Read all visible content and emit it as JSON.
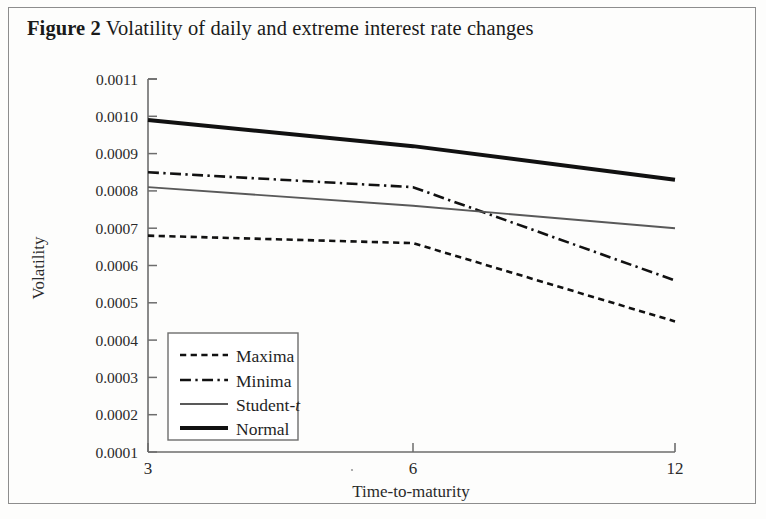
{
  "figure": {
    "label": "Figure 2",
    "title": "Volatility of daily and extreme interest rate changes"
  },
  "chart_data": {
    "type": "line",
    "title": "Volatility of daily and extreme interest rate changes",
    "xlabel": "Time-to-maturity",
    "ylabel": "Volatility",
    "x_ticks": [
      3,
      6,
      12
    ],
    "x_tick_labels": [
      "3",
      "6",
      "12"
    ],
    "xlim": [
      3,
      12
    ],
    "y_ticks": [
      0.0001,
      0.0002,
      0.0003,
      0.0004,
      0.0005,
      0.0006,
      0.0007,
      0.0008,
      0.0009,
      0.001,
      0.0011
    ],
    "y_tick_labels": [
      "0.0001",
      "0.0002",
      "0.0003",
      "0.0004",
      "0.0005",
      "0.0006",
      "0.0007",
      "0.0008",
      "0.0009",
      "0.0010",
      "0.0011"
    ],
    "ylim": [
      0.0001,
      0.0011
    ],
    "grid": false,
    "legend_position": "lower left",
    "x": [
      3,
      6,
      12
    ],
    "series": [
      {
        "name": "Maxima",
        "style": "dashed",
        "color": "#111111",
        "width": 2.6,
        "values": [
          0.00068,
          0.00066,
          0.00045
        ]
      },
      {
        "name": "Minima",
        "style": "dashdot",
        "color": "#111111",
        "width": 2.6,
        "values": [
          0.00085,
          0.00081,
          0.00056
        ]
      },
      {
        "name": "Student-t",
        "style": "solid",
        "color": "#595959",
        "width": 1.9,
        "values": [
          0.00081,
          0.00076,
          0.0007
        ]
      },
      {
        "name": "Normal",
        "style": "solid",
        "color": "#111111",
        "width": 4.0,
        "values": [
          0.00099,
          0.00092,
          0.00083
        ]
      }
    ],
    "annotations": [
      {
        "text": "Student-t crosses above Minima",
        "x": 8.3,
        "y": 0.000735
      }
    ]
  },
  "legend": {
    "entries": [
      {
        "label": "Maxima",
        "label_plain": "Maxima",
        "italic_suffix": ""
      },
      {
        "label": "Minima",
        "label_plain": "Minima",
        "italic_suffix": ""
      },
      {
        "label": "Student-",
        "label_plain": "Student-t",
        "italic_suffix": "t"
      },
      {
        "label": "Normal",
        "label_plain": "Normal",
        "italic_suffix": ""
      }
    ]
  }
}
